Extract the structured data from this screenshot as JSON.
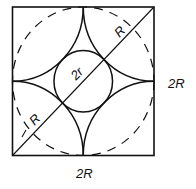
{
  "diagram": {
    "labels": {
      "side_right": "2R",
      "side_bottom": "2R",
      "radius_upper": "R",
      "radius_lower": "R",
      "inner_diameter": "2r"
    },
    "shapes": {
      "square": "outer square of side 2R",
      "dashed_circle": "circumscribed dashed circle of radius R",
      "corner_arcs": "four quarter-circle arcs of radius R centered at square corners",
      "inner_circle": "inscribed circle of diameter 2r",
      "diagonal": "diagonal from bottom-left to top-right corner"
    }
  }
}
